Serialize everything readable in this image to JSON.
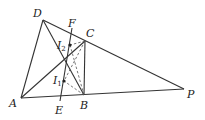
{
  "diagram": {
    "type": "geometry",
    "points": {
      "D": {
        "label": "D",
        "x": 43,
        "y": 20,
        "lx": 33,
        "ly": 17
      },
      "F": {
        "label": "F",
        "x": 72,
        "y": 30,
        "lx": 68,
        "ly": 25
      },
      "C": {
        "label": "C",
        "x": 85,
        "y": 41,
        "lx": 86,
        "ly": 36
      },
      "I2": {
        "label": "I",
        "sub": "2",
        "x": 70,
        "y": 45,
        "lx": 57,
        "ly": 48
      },
      "I1": {
        "label": "I",
        "sub": "1",
        "x": 64,
        "y": 81,
        "lx": 53,
        "ly": 83
      },
      "A": {
        "label": "A",
        "x": 21,
        "y": 98,
        "lx": 9,
        "ly": 107
      },
      "E": {
        "label": "E",
        "x": 60,
        "y": 100,
        "lx": 55,
        "ly": 113
      },
      "B": {
        "label": "B",
        "x": 84,
        "y": 95,
        "lx": 80,
        "ly": 109
      },
      "P": {
        "label": "P",
        "x": 184,
        "y": 89,
        "lx": 187,
        "ly": 98
      }
    },
    "segments": [
      [
        "D",
        "P"
      ],
      [
        "D",
        "A"
      ],
      [
        "A",
        "P"
      ],
      [
        "A",
        "C"
      ],
      [
        "D",
        "B"
      ],
      [
        "C",
        "B"
      ],
      [
        "E",
        "F"
      ]
    ],
    "dashed_segments": [
      [
        "C",
        "I2"
      ],
      [
        "B",
        "I2"
      ],
      [
        "C",
        "I1"
      ],
      [
        "B",
        "I1"
      ]
    ],
    "stroke_color": "#333333"
  }
}
